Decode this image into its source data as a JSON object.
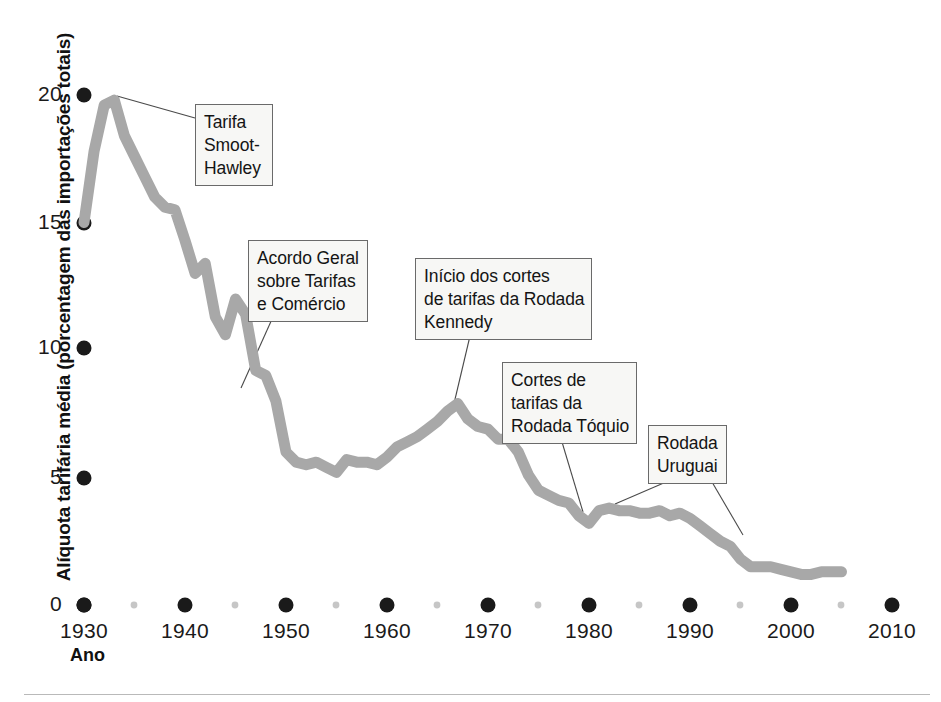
{
  "chart_data": {
    "type": "line",
    "title": "",
    "xlabel": "Ano",
    "ylabel": "Alíquota tarifária média (porcentagem das importações totais)",
    "xlim": [
      1930,
      2010
    ],
    "ylim": [
      0,
      20
    ],
    "grid": false,
    "legend": "none",
    "line_color": "#a8a8a8",
    "axis_color": "#1a1a1a",
    "x_ticks": [
      "1930",
      "1940",
      "1950",
      "1960",
      "1970",
      "1980",
      "1990",
      "2000",
      "2010"
    ],
    "x_tick_values": [
      1930,
      1940,
      1950,
      1960,
      1970,
      1980,
      1990,
      2000,
      2010
    ],
    "x_minor_ticks": [
      1935,
      1945,
      1955,
      1965,
      1975,
      1985,
      1995,
      2005
    ],
    "y_ticks": [
      "0",
      "5",
      "10",
      "15",
      "20"
    ],
    "y_tick_values": [
      0,
      5,
      10,
      15,
      20
    ],
    "series": [
      {
        "name": "Alíquota tarifária média",
        "x": [
          1930,
          1931,
          1932,
          1933,
          1934,
          1935,
          1936,
          1937,
          1938,
          1939,
          1940,
          1941,
          1942,
          1943,
          1944,
          1945,
          1946,
          1947,
          1948,
          1949,
          1950,
          1951,
          1952,
          1953,
          1954,
          1955,
          1956,
          1957,
          1958,
          1959,
          1960,
          1961,
          1962,
          1963,
          1964,
          1965,
          1966,
          1967,
          1968,
          1969,
          1970,
          1971,
          1972,
          1973,
          1974,
          1975,
          1976,
          1977,
          1978,
          1979,
          1980,
          1981,
          1982,
          1983,
          1984,
          1985,
          1986,
          1987,
          1988,
          1989,
          1990,
          1991,
          1992,
          1993,
          1994,
          1995,
          1996,
          1997,
          1998,
          1999,
          2000,
          2001,
          2002,
          2003,
          2004,
          2005
        ],
        "y": [
          15.0,
          17.8,
          19.6,
          19.8,
          18.4,
          17.6,
          16.8,
          16.0,
          15.6,
          15.5,
          14.3,
          13.0,
          13.4,
          11.3,
          10.6,
          12.0,
          11.4,
          9.2,
          9.0,
          8.0,
          6.0,
          5.6,
          5.5,
          5.6,
          5.4,
          5.2,
          5.7,
          5.6,
          5.6,
          5.5,
          5.8,
          6.2,
          6.4,
          6.6,
          6.9,
          7.2,
          7.6,
          7.9,
          7.3,
          7.0,
          6.9,
          6.5,
          6.5,
          6.0,
          5.1,
          4.5,
          4.3,
          4.1,
          4.0,
          3.5,
          3.2,
          3.7,
          3.8,
          3.7,
          3.7,
          3.6,
          3.6,
          3.7,
          3.5,
          3.6,
          3.4,
          3.1,
          2.8,
          2.5,
          2.3,
          1.8,
          1.5,
          1.5,
          1.5,
          1.4,
          1.3,
          1.2,
          1.2,
          1.3,
          1.3,
          1.3
        ]
      }
    ],
    "annotations": [
      {
        "id": "smoot-hawley",
        "lines": [
          "Tarifa",
          "Smoot-",
          "Hawley"
        ],
        "target_x": 1933,
        "target_y": 19.8
      },
      {
        "id": "gatt",
        "lines": [
          "Acordo Geral",
          "sobre Tarifas",
          "e Comércio"
        ],
        "target_x": 1947,
        "target_y": 9.2
      },
      {
        "id": "kennedy-round",
        "lines": [
          "Início dos cortes",
          "de tarifas da Rodada",
          "Kennedy"
        ],
        "target_x": 1968,
        "target_y": 7.3
      },
      {
        "id": "tokyo-round",
        "lines": [
          "Cortes de",
          "tarifas da",
          "Rodada Tóquio"
        ],
        "target_x": 1979,
        "target_y": 3.5
      },
      {
        "id": "uruguay-round",
        "lines": [
          "Rodada",
          "Uruguai"
        ],
        "target_x": 1989,
        "target_y": 3.6,
        "target2_x": 1994,
        "target2_y": 2.3
      }
    ]
  },
  "axis": {
    "y_title": "Alíquota tarifária média (porcentagem das importações totais)",
    "x_title": "Ano",
    "y_labels": [
      "20",
      "15",
      "10",
      "5",
      "0"
    ],
    "x_labels": [
      "1930",
      "1940",
      "1950",
      "1960",
      "1970",
      "1980",
      "1990",
      "2000",
      "2010"
    ]
  },
  "callouts": {
    "smoot": {
      "l1": "Tarifa",
      "l2": "Smoot-",
      "l3": "Hawley"
    },
    "gatt": {
      "l1": "Acordo Geral",
      "l2": "sobre Tarifas",
      "l3": "e Comércio"
    },
    "kennedy": {
      "l1": "Início dos cortes",
      "l2": "de tarifas da Rodada",
      "l3": "Kennedy"
    },
    "tokyo": {
      "l1": "Cortes de",
      "l2": "tarifas da",
      "l3": "Rodada Tóquio"
    },
    "uruguay": {
      "l1": "Rodada",
      "l2": "Uruguai"
    }
  }
}
